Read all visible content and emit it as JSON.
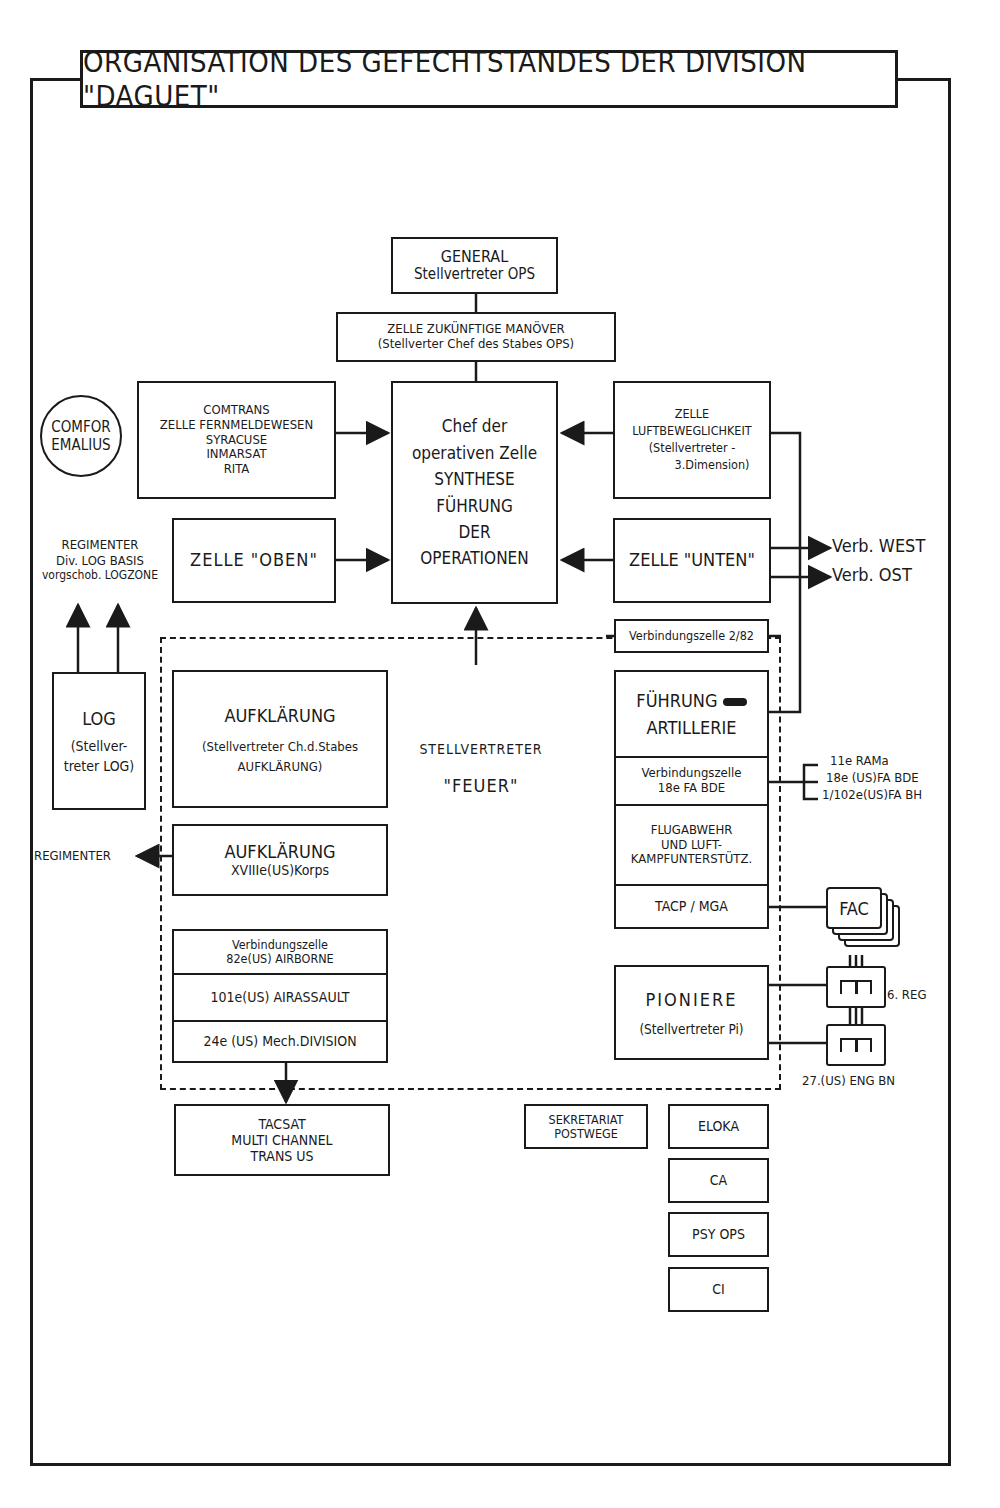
{
  "title": "ORGANISATION DES GEFECHTSTANDES DER DIVISION \"DAGUET\"",
  "general": {
    "line1": "GENERAL",
    "line2": "Stellvertreter OPS"
  },
  "zelle_manoever": {
    "line1": "ZELLE ZUKÜNFTIGE MANÖVER",
    "line2": "(Stellverter Chef des Stabes OPS)"
  },
  "chef": {
    "line1": "Chef der",
    "line2": "operativen Zelle",
    "line3": "SYNTHESE",
    "line4": "FÜHRUNG",
    "line5": "DER",
    "line6": "OPERATIONEN"
  },
  "comtrans": {
    "line1": "COMTRANS",
    "line2": "ZELLE FERNMELDEWESEN",
    "line3": "SYRACUSE",
    "line4": "INMARSAT",
    "line5": "RITA"
  },
  "comfor": {
    "line1": "COMFOR",
    "line2": "EMALIUS"
  },
  "zelle_oben": "ZELLE \"OBEN\"",
  "regimenter_log": {
    "line1": "REGIMENTER",
    "line2": "Div. LOG BASIS",
    "line3": "vorgschob. LOGZONE"
  },
  "luftbeweglichkeit": {
    "line1": "ZELLE",
    "line2": "LUFTBEWEGLICHKEIT",
    "line3": "(Stellvertreter -",
    "line4": "3.Dimension)"
  },
  "zelle_unten": "ZELLE \"UNTEN\"",
  "verb_west": "Verb. WEST",
  "verb_ost": "Verb. OST",
  "verbindungszelle_282": "Verbindungszelle 2/82",
  "log": {
    "line1": "LOG",
    "line2": "(Stellver-",
    "line3": "treter LOG)"
  },
  "aufklaerung1": {
    "line1": "AUFKLÄRUNG",
    "line2": "(Stellvertreter Ch.d.Stabes",
    "line3": "AUFKLÄRUNG)"
  },
  "aufklaerung2": {
    "line1": "AUFKLÄRUNG",
    "line2": "XVIIIe(US)Korps"
  },
  "regimenter_left": "REGIMENTER",
  "feuer": {
    "line1": "STELLVERTRETER",
    "line2": "\"FEUER\""
  },
  "artillerie": {
    "fuehrung": {
      "line1": "FÜHRUNG",
      "line2": "ARTILLERIE"
    },
    "verbindungszelle": {
      "line1": "Verbindungszelle",
      "line2": "18e FA BDE"
    },
    "flugabwehr": {
      "line1": "FLUGABWEHR",
      "line2": "UND LUFT-",
      "line3": "KAMPFUNTERSTÜTZ."
    },
    "tacp": "TACP / MGA"
  },
  "fa_units": [
    "11e RAMa",
    "18e (US)FA BDE",
    "1/102e(US)FA BH"
  ],
  "fac": "FAC",
  "pioniere": {
    "line1": "PIONIERE",
    "line2": "(Stellvertreter Pi)"
  },
  "reg_6": "6. REG",
  "eng_bn": "27.(US) ENG BN",
  "us_units": {
    "verbindungszelle": {
      "line1": "Verbindungszelle",
      "line2": "82e(US) AIRBORNE"
    },
    "airassault": "101e(US) AIRASSAULT",
    "mech": "24e (US) Mech.DIVISION"
  },
  "tacsat": {
    "line1": "TACSAT",
    "line2": "MULTI CHANNEL",
    "line3": "TRANS US"
  },
  "sekretariat": {
    "line1": "SEKRETARIAT",
    "line2": "POSTWEGE"
  },
  "side_cells": [
    "ELOKA",
    "CA",
    "PSY OPS",
    "CI"
  ]
}
